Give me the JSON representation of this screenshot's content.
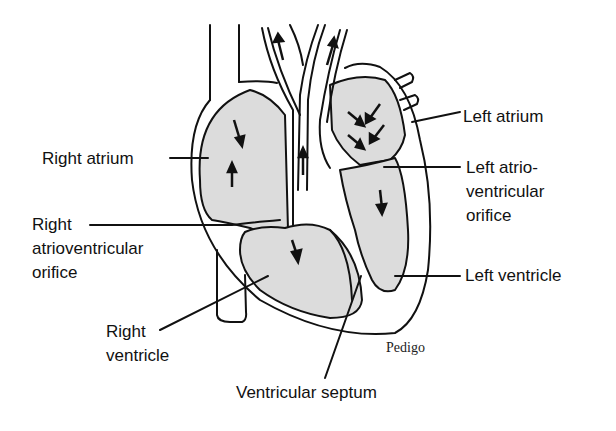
{
  "diagram": {
    "colors": {
      "chamber_fill": "#dcdcdc",
      "line": "#111111",
      "background": "#ffffff"
    },
    "labels": {
      "right_atrium": "Right atrium",
      "right_av_orifice_1": "Right",
      "right_av_orifice_2": "atrioventricular",
      "right_av_orifice_3": "orifice",
      "right_ventricle_1": "Right",
      "right_ventricle_2": "ventricle",
      "left_atrium": "Left atrium",
      "left_av_orifice_1": "Left atrio-",
      "left_av_orifice_2": "ventricular",
      "left_av_orifice_3": "orifice",
      "left_ventricle": "Left ventricle",
      "ventricular_septum": "Ventricular septum"
    },
    "signature": "Pedigo"
  }
}
